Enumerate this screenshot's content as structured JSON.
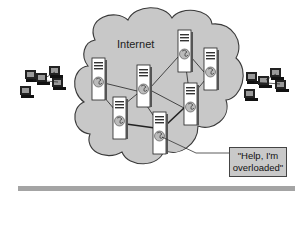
{
  "diagram": {
    "cloud_label": "Internet",
    "callout_line1": "\"Help, I'm",
    "callout_line2": "overloaded\"",
    "colors": {
      "cloud_fill": "#c8c8c8",
      "cloud_stroke": "#3a3a3a",
      "server_fill": "#ffffff",
      "callout_fill": "#c9c9c9",
      "bottom_bar": "#a4a4a4"
    },
    "servers": [
      {
        "id": "S1",
        "x": 92,
        "y": 58
      },
      {
        "id": "S2",
        "x": 137,
        "y": 65
      },
      {
        "id": "S3",
        "x": 178,
        "y": 30
      },
      {
        "id": "S4",
        "x": 204,
        "y": 48
      },
      {
        "id": "S5",
        "x": 184,
        "y": 83
      },
      {
        "id": "S6",
        "x": 113,
        "y": 97
      },
      {
        "id": "S7",
        "x": 153,
        "y": 112
      }
    ],
    "links": [
      [
        "S1",
        "S2"
      ],
      [
        "S2",
        "S3"
      ],
      [
        "S3",
        "S4"
      ],
      [
        "S2",
        "S5"
      ],
      [
        "S4",
        "S5"
      ],
      [
        "S1",
        "S6"
      ],
      [
        "S2",
        "S7"
      ],
      [
        "S6",
        "S7"
      ],
      [
        "S7",
        "S5"
      ],
      [
        "S3",
        "S5"
      ]
    ],
    "client_groups": [
      "left-client-group",
      "right-client-group"
    ]
  }
}
